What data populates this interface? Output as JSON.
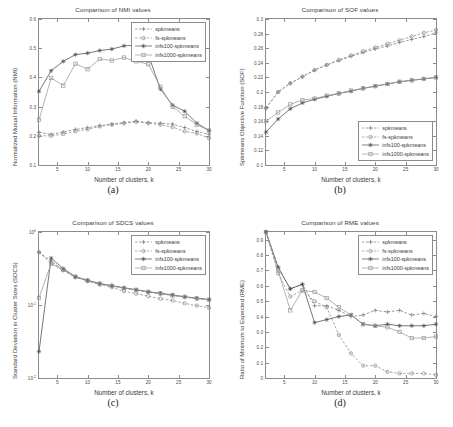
{
  "figure": {
    "background": "#ffffff",
    "series_colors": {
      "spkmeans": "#7a7a7a",
      "fs-spkmeans": "#8a8a8a",
      "infs100-spkmeans": "#4a4a4a",
      "infs1000-spkmeans": "#9a9a9a"
    }
  },
  "panels": [
    {
      "id": "a",
      "sublabel": "(a)",
      "title": "Comparison of NMI values",
      "xlabel": "Number of clusters, k",
      "ylabel": "Normalized Mutual Information (NMI)",
      "xticks": [
        "5",
        "10",
        "15",
        "20",
        "25",
        "30"
      ],
      "yticks": [
        "0.1",
        "0.2",
        "0.3",
        "0.4",
        "0.5",
        "0.6"
      ],
      "legend_labels": [
        "spkmeans",
        "fs-spkmeans",
        "infs100-spkmeans",
        "infs1000-spkmeans"
      ],
      "legend_position": "top-right"
    },
    {
      "id": "b",
      "sublabel": "(b)",
      "title": "Comparison of SOF values",
      "xlabel": "Number of clusters, k",
      "ylabel": "Spkmeans Objective Function (SOF)",
      "xticks": [
        "5",
        "10",
        "15",
        "20",
        "25",
        "30"
      ],
      "yticks": [
        "0.1",
        "0.12",
        "0.14",
        "0.16",
        "0.18",
        "0.2",
        "0.22",
        "0.24",
        "0.26",
        "0.28",
        "0.3"
      ],
      "legend_labels": [
        "spkmeans",
        "fs-spkmeans",
        "infs100-spkmeans",
        "infs1000-spkmeans"
      ],
      "legend_position": "bottom-right"
    },
    {
      "id": "c",
      "sublabel": "(c)",
      "title": "Comparison of SDCS values",
      "xlabel": "Number of clusters, k",
      "ylabel": "Standard Deviation in Cluster Sizes (SDCS)",
      "xticks": [
        "5",
        "10",
        "15",
        "20",
        "25",
        "30"
      ],
      "yticks": [
        "10^0",
        "10^-1",
        "10^-2"
      ],
      "legend_labels": [
        "spkmeans",
        "fs-spkmeans",
        "infs100-spkmeans",
        "infs1000-spkmeans"
      ],
      "legend_position": "top-right"
    },
    {
      "id": "d",
      "sublabel": "(d)",
      "title": "Comparison of RME values",
      "xlabel": "Number of clusters, k",
      "ylabel": "Ratio of Minimum to Expected (RME)",
      "xticks": [
        "5",
        "10",
        "15",
        "20",
        "25",
        "30"
      ],
      "yticks": [
        "0",
        "0.1",
        "0.2",
        "0.3",
        "0.4",
        "0.5",
        "0.6",
        "0.7",
        "0.8",
        "0.9"
      ],
      "legend_labels": [
        "spkmeans",
        "fs-spkmeans",
        "infs100-spkmeans",
        "infs1000-spkmeans"
      ],
      "legend_position": "top-right"
    }
  ],
  "chart_data": [
    {
      "type": "line",
      "panel": "a",
      "title": "Comparison of NMI values",
      "xlabel": "Number of clusters, k",
      "ylabel": "Normalized Mutual Information (NMI)",
      "xlim": [
        2,
        30
      ],
      "ylim": [
        0.1,
        0.6
      ],
      "grid": false,
      "legend_position": "top-right",
      "x": [
        2,
        4,
        6,
        8,
        10,
        12,
        14,
        16,
        18,
        20,
        22,
        24,
        26,
        28,
        30
      ],
      "series": [
        {
          "name": "spkmeans",
          "marker": "plus",
          "linestyle": "dashed",
          "values": [
            0.212,
            0.205,
            0.213,
            0.222,
            0.228,
            0.235,
            0.24,
            0.245,
            0.25,
            0.245,
            0.243,
            0.24,
            0.228,
            0.215,
            0.205
          ]
        },
        {
          "name": "fs-spkmeans",
          "marker": "circle",
          "linestyle": "dashed",
          "values": [
            0.2,
            0.2,
            0.206,
            0.215,
            0.222,
            0.232,
            0.238,
            0.243,
            0.248,
            0.243,
            0.238,
            0.23,
            0.215,
            0.208,
            0.192
          ]
        },
        {
          "name": "infs100-spkmeans",
          "marker": "star",
          "linestyle": "solid",
          "values": [
            0.352,
            0.423,
            0.455,
            0.478,
            0.483,
            0.492,
            0.497,
            0.508,
            0.51,
            0.478,
            0.36,
            0.305,
            0.284,
            0.243,
            0.218
          ]
        },
        {
          "name": "infs1000-spkmeans",
          "marker": "square",
          "linestyle": "solid",
          "values": [
            0.255,
            0.398,
            0.372,
            0.447,
            0.428,
            0.463,
            0.458,
            0.468,
            0.455,
            0.445,
            0.368,
            0.3,
            0.267,
            0.238,
            0.218
          ]
        }
      ]
    },
    {
      "type": "line",
      "panel": "b",
      "title": "Comparison of SOF values",
      "xlabel": "Number of clusters, k",
      "ylabel": "Spkmeans Objective Function (SOF)",
      "xlim": [
        2,
        30
      ],
      "ylim": [
        0.1,
        0.3
      ],
      "grid": false,
      "legend_position": "bottom-right",
      "x": [
        2,
        4,
        6,
        8,
        10,
        12,
        14,
        16,
        18,
        20,
        22,
        24,
        26,
        28,
        30
      ],
      "series": [
        {
          "name": "spkmeans",
          "marker": "plus",
          "linestyle": "dashed",
          "values": [
            0.178,
            0.2,
            0.212,
            0.221,
            0.23,
            0.237,
            0.243,
            0.249,
            0.254,
            0.259,
            0.263,
            0.268,
            0.272,
            0.276,
            0.281
          ]
        },
        {
          "name": "fs-spkmeans",
          "marker": "circle",
          "linestyle": "dashed",
          "values": [
            0.178,
            0.2,
            0.212,
            0.221,
            0.23,
            0.237,
            0.244,
            0.25,
            0.256,
            0.261,
            0.266,
            0.271,
            0.276,
            0.281,
            0.285
          ]
        },
        {
          "name": "infs100-spkmeans",
          "marker": "star",
          "linestyle": "solid",
          "values": [
            0.145,
            0.163,
            0.177,
            0.185,
            0.19,
            0.194,
            0.198,
            0.201,
            0.205,
            0.208,
            0.211,
            0.214,
            0.216,
            0.218,
            0.22
          ]
        },
        {
          "name": "infs1000-spkmeans",
          "marker": "square",
          "linestyle": "solid",
          "values": [
            0.16,
            0.172,
            0.183,
            0.189,
            0.191,
            0.195,
            0.198,
            0.202,
            0.205,
            0.208,
            0.211,
            0.214,
            0.216,
            0.218,
            0.22
          ]
        }
      ]
    },
    {
      "type": "line",
      "panel": "c",
      "title": "Comparison of SDCS values",
      "xlabel": "Number of clusters, k",
      "ylabel": "Standard Deviation in Cluster Sizes (SDCS)",
      "xlim": [
        2,
        30
      ],
      "ylim": [
        0.01,
        1.0
      ],
      "yscale": "log",
      "grid": false,
      "legend_position": "top-right",
      "x": [
        2,
        4,
        6,
        8,
        10,
        12,
        14,
        16,
        18,
        20,
        22,
        24,
        26,
        28,
        30
      ],
      "series": [
        {
          "name": "spkmeans",
          "marker": "plus",
          "linestyle": "dashed",
          "values": [
            0.53,
            0.4,
            0.3,
            0.24,
            0.215,
            0.195,
            0.183,
            0.17,
            0.16,
            0.15,
            0.143,
            0.135,
            0.128,
            0.122,
            0.118
          ]
        },
        {
          "name": "fs-spkmeans",
          "marker": "circle",
          "linestyle": "dashed",
          "values": [
            0.53,
            0.37,
            0.3,
            0.24,
            0.213,
            0.19,
            0.175,
            0.155,
            0.143,
            0.132,
            0.122,
            0.115,
            0.105,
            0.098,
            0.092
          ]
        },
        {
          "name": "infs100-spkmeans",
          "marker": "star",
          "linestyle": "solid",
          "values": [
            0.023,
            0.44,
            0.315,
            0.245,
            0.218,
            0.197,
            0.184,
            0.172,
            0.162,
            0.152,
            0.145,
            0.137,
            0.13,
            0.124,
            0.119
          ]
        },
        {
          "name": "infs1000-spkmeans",
          "marker": "square",
          "linestyle": "solid",
          "values": [
            0.125,
            0.37,
            0.305,
            0.243,
            0.216,
            0.196,
            0.183,
            0.171,
            0.161,
            0.151,
            0.144,
            0.136,
            0.129,
            0.123,
            0.118
          ]
        }
      ]
    },
    {
      "type": "line",
      "panel": "d",
      "title": "Comparison of RME values",
      "xlabel": "Number of clusters, k",
      "ylabel": "Ratio of Minimum to Expected (RME)",
      "xlim": [
        2,
        30
      ],
      "ylim": [
        0.0,
        0.95
      ],
      "grid": false,
      "legend_position": "top-right",
      "x": [
        2,
        4,
        6,
        8,
        10,
        12,
        14,
        16,
        18,
        20,
        22,
        24,
        26,
        28,
        30
      ],
      "series": [
        {
          "name": "spkmeans",
          "marker": "plus",
          "linestyle": "dashed",
          "values": [
            0.95,
            0.72,
            0.58,
            0.61,
            0.47,
            0.47,
            0.44,
            0.4,
            0.41,
            0.44,
            0.43,
            0.44,
            0.41,
            0.42,
            0.4
          ]
        },
        {
          "name": "fs-spkmeans",
          "marker": "circle",
          "linestyle": "dashed",
          "values": [
            0.95,
            0.68,
            0.53,
            0.57,
            0.5,
            0.46,
            0.28,
            0.16,
            0.08,
            0.08,
            0.04,
            0.03,
            0.03,
            0.03,
            0.02
          ]
        },
        {
          "name": "infs100-spkmeans",
          "marker": "star",
          "linestyle": "solid",
          "values": [
            0.95,
            0.72,
            0.58,
            0.61,
            0.36,
            0.38,
            0.4,
            0.41,
            0.35,
            0.34,
            0.35,
            0.34,
            0.34,
            0.34,
            0.35
          ]
        },
        {
          "name": "infs1000-spkmeans",
          "marker": "square",
          "linestyle": "solid",
          "values": [
            0.95,
            0.7,
            0.44,
            0.57,
            0.56,
            0.52,
            0.46,
            0.41,
            0.35,
            0.34,
            0.33,
            0.3,
            0.26,
            0.26,
            0.27
          ]
        }
      ]
    }
  ]
}
